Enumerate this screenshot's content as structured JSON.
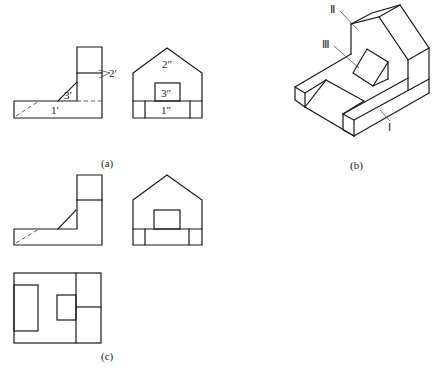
{
  "figure": {
    "captions": {
      "a": "(a)",
      "b": "(b)",
      "c": "(c)"
    },
    "view_a": {
      "front_view_labels": {
        "part1": "1′",
        "part2": "2′",
        "part3": "3′"
      },
      "side_view_labels": {
        "part1": "1″",
        "part2": "2″",
        "part3": "3″"
      }
    },
    "view_b": {
      "labels": {
        "part1": "Ⅰ",
        "part2": "Ⅱ",
        "part3": "Ⅲ"
      }
    }
  }
}
